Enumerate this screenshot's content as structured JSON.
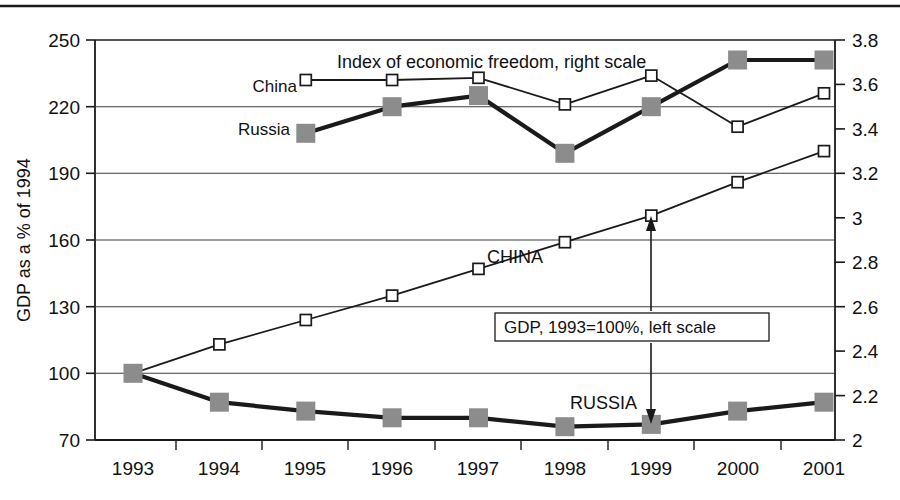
{
  "chart_data": {
    "type": "line",
    "title": "",
    "x": [
      "1993",
      "1994",
      "1995",
      "1996",
      "1997",
      "1998",
      "1999",
      "2000",
      "2001"
    ],
    "xlabel": "",
    "ylabel": "GDP as a % of 1994",
    "ylim": [
      70,
      250
    ],
    "y_ticks": [
      "70",
      "100",
      "130",
      "160",
      "190",
      "220",
      "250"
    ],
    "y2label": "",
    "y2lim": [
      2.0,
      3.8
    ],
    "y2_ticks": [
      "2",
      "2.2",
      "2.4",
      "2.6",
      "2.8",
      "3",
      "3.2",
      "3.4",
      "3.6",
      "3.8"
    ],
    "grid": true,
    "legend_position": "inline-annotations",
    "annotations": [
      {
        "name": "index-group-label",
        "text": "Index of economic freedom, right scale"
      },
      {
        "name": "gdp-group-label",
        "text": "GDP, 1993=100%, left scale"
      },
      {
        "name": "china-index-label",
        "text": "China"
      },
      {
        "name": "russia-index-label",
        "text": "Russia"
      },
      {
        "name": "china-gdp-label",
        "text": "CHINA"
      },
      {
        "name": "russia-gdp-label",
        "text": "RUSSIA"
      }
    ],
    "series": [
      {
        "name": "CHINA",
        "axis": "left",
        "marker": "open-square",
        "color": "#1a1a1a",
        "x": [
          "1993",
          "1994",
          "1995",
          "1996",
          "1997",
          "1998",
          "1999",
          "2000",
          "2001"
        ],
        "values": [
          100,
          113,
          124,
          135,
          147,
          159,
          171,
          186,
          200
        ]
      },
      {
        "name": "RUSSIA",
        "axis": "left",
        "marker": "filled-square",
        "color": "#8c8c8c",
        "x": [
          "1993",
          "1994",
          "1995",
          "1996",
          "1997",
          "1998",
          "1999",
          "2000",
          "2001"
        ],
        "values": [
          100,
          87,
          83,
          80,
          80,
          76,
          77,
          83,
          87
        ]
      },
      {
        "name": "China",
        "axis": "right",
        "marker": "open-square",
        "color": "#1a1a1a",
        "x": [
          "1995",
          "1996",
          "1997",
          "1998",
          "1999",
          "2000",
          "2001"
        ],
        "values": [
          3.62,
          3.62,
          3.63,
          3.51,
          3.64,
          3.41,
          3.56
        ]
      },
      {
        "name": "Russia",
        "axis": "right",
        "marker": "filled-square",
        "color": "#8c8c8c",
        "x": [
          "1995",
          "1996",
          "1997",
          "1998",
          "1999",
          "2000",
          "2001"
        ],
        "values": [
          3.38,
          3.5,
          3.55,
          3.29,
          3.5,
          3.71,
          3.71
        ]
      }
    ]
  },
  "colors": {
    "axis": "#1a1a1a",
    "grid": "#4d4d4d",
    "china": "#1a1a1a",
    "russia": "#8c8c8c",
    "background": "#ffffff"
  },
  "labels": {
    "y_axis_title": "GDP as a % of 1994",
    "index_note": "Index of economic freedom, right scale",
    "gdp_note": "GDP, 1993=100%, left scale",
    "china_small": "China",
    "russia_small": "Russia",
    "china_caps": "CHINA",
    "russia_caps": "RUSSIA"
  },
  "y_ticks": [
    {
      "label": "250"
    },
    {
      "label": "220"
    },
    {
      "label": "190"
    },
    {
      "label": "160"
    },
    {
      "label": "130"
    },
    {
      "label": "100"
    },
    {
      "label": "70"
    }
  ],
  "y2_ticks": [
    {
      "label": "3.8"
    },
    {
      "label": "3.6"
    },
    {
      "label": "3.4"
    },
    {
      "label": "3.2"
    },
    {
      "label": "3"
    },
    {
      "label": "2.8"
    },
    {
      "label": "2.6"
    },
    {
      "label": "2.4"
    },
    {
      "label": "2.2"
    },
    {
      "label": "2"
    }
  ],
  "x_ticks": [
    {
      "label": "1993"
    },
    {
      "label": "1994"
    },
    {
      "label": "1995"
    },
    {
      "label": "1996"
    },
    {
      "label": "1997"
    },
    {
      "label": "1998"
    },
    {
      "label": "1999"
    },
    {
      "label": "2000"
    },
    {
      "label": "2001"
    }
  ]
}
